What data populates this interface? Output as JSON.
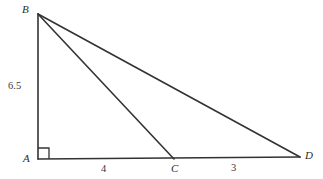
{
  "figure": {
    "kind": "geometry-diagram",
    "background_color": "#ffffff",
    "stroke_color": "#333333",
    "vertices": {
      "B": {
        "label": "B",
        "x": 38,
        "y": 14
      },
      "A": {
        "label": "A",
        "x": 38,
        "y": 159
      },
      "C": {
        "label": "C",
        "x": 174,
        "y": 159
      },
      "D": {
        "label": "D",
        "x": 300,
        "y": 157
      }
    },
    "segments": [
      {
        "name": "AB",
        "from": "B",
        "to": "A"
      },
      {
        "name": "BC",
        "from": "B",
        "to": "C"
      },
      {
        "name": "BD",
        "from": "B",
        "to": "D"
      },
      {
        "name": "AD",
        "from": "A",
        "to": "D"
      }
    ],
    "right_angle": {
      "at": "A",
      "marker": "square",
      "size": 11
    },
    "measures": {
      "AB": "6.5",
      "AC": "4",
      "CD": "3"
    }
  }
}
